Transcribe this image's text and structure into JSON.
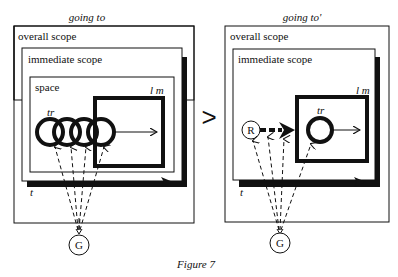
{
  "figure": {
    "caption": "Figure 7",
    "comparator": ">"
  },
  "left": {
    "title": "going to",
    "overall_scope": "overall scope",
    "immediate_scope": "immediate scope",
    "space": "space",
    "landmark": "l m",
    "trajector": "tr",
    "time": "t",
    "ground": "G"
  },
  "right": {
    "title": "going to'",
    "overall_scope": "overall scope",
    "immediate_scope": "immediate scope",
    "landmark": "l m",
    "trajector": "tr",
    "time": "t",
    "reference": "R",
    "ground": "G"
  }
}
